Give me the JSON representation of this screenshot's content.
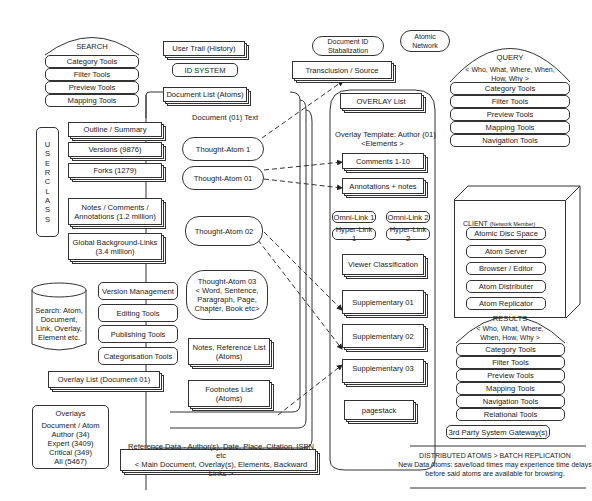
{
  "search": {
    "title": "SEARCH",
    "items": [
      "Category Tools",
      "Filter Tools",
      "Preview Tools",
      "Mapping Tools"
    ]
  },
  "top": {
    "user_trail": "User Trail (History)",
    "id_system": "ID SYSTEM",
    "doc_id": "Document ID Stabalization",
    "atomic_network": "Atomic Network",
    "transclusion": "Transclusion / Source"
  },
  "document": {
    "list": "Document List (Atoms)",
    "title": "Document (01) Text",
    "atoms": [
      "Thought-Atom 1",
      "Thought-Atom 01",
      "Thought-Atom 02"
    ],
    "atom03": [
      "Thought-Atom 03",
      "< Word, Sentence,",
      "Paragraph, Page,",
      "Chapter, Book etc>"
    ],
    "notes": [
      "Notes, Reference List",
      "(Atoms)"
    ],
    "footnotes": [
      "Footnotes List",
      "(Atoms)"
    ]
  },
  "user_class": {
    "label": "U S E R   C L A S S",
    "items": [
      "Outline / Summary",
      "Versions (9876)",
      "Forks (1279)"
    ],
    "notes": [
      "Notes / Comments /",
      "Annotations (1.2 million)"
    ],
    "global": [
      "Global Background-Links",
      "(3.4 million)"
    ]
  },
  "tools": [
    "Version Management",
    "Editing Tools",
    "Publishing Tools",
    "Categorisation Tools"
  ],
  "db": [
    "Search: Atom,",
    "Document,",
    "Link, Overlay,",
    "Element etc."
  ],
  "overlay_list_doc": "Overlay List (Document 01)",
  "overlays": {
    "title": "Overlays",
    "items": [
      "Document / Atom",
      "Author (34)",
      "Expert (3409)",
      "Critical (349)",
      "All (5467)"
    ]
  },
  "reference": [
    "Reference Data - Author(s),  Date, Place, Citation, ISBN etc",
    "< Main Document, Overlay(s), Elements, Backward Links >"
  ],
  "overlay": {
    "list": "OVERLAY List",
    "template": [
      "Overlay Template: Author (01)",
      "<Elements >"
    ],
    "comments": "Comments 1-10",
    "annotations": "Annotations + notes",
    "links": [
      "Omni-Link 1",
      "Omni-Link 2",
      "Hyper-Link 1",
      "Hyper-Link 2"
    ],
    "viewer": "Viewer Classification",
    "supp": [
      "Supplementary 01",
      "Supplementary 02",
      "Supplementary 03"
    ],
    "pagestack": "pagestack"
  },
  "query": {
    "title": "QUERY",
    "sub": [
      "< Who, What, Where, When,",
      "How, Why >"
    ],
    "items": [
      "Category Tools",
      "Filter Tools",
      "Preview Tools",
      "Mapping Tools",
      "Navigation Tools"
    ]
  },
  "client": {
    "title": "CLIENT",
    "sub": "(Network Member)",
    "items": [
      "Atomic Disc Space",
      "Atom Server",
      "Browser / Editor",
      "Atom Distributer",
      "Atom Replicator"
    ]
  },
  "results": {
    "title": "RESULTS",
    "sub": [
      "< Who, What, Where,",
      "When, How, Why >"
    ],
    "items": [
      "Category Tools",
      "Filter Tools",
      "Preview Tools",
      "Mapping Tools",
      "Navigation Tools",
      "Relational Tools"
    ]
  },
  "gateway": "3rd Party System Gateway(s)",
  "distributed": [
    "DISTRIBUTED ATOMS > BATCH REPLICATION",
    "New Data Atoms: save/load times may experience time delays",
    "before said atoms are available for browsing."
  ]
}
